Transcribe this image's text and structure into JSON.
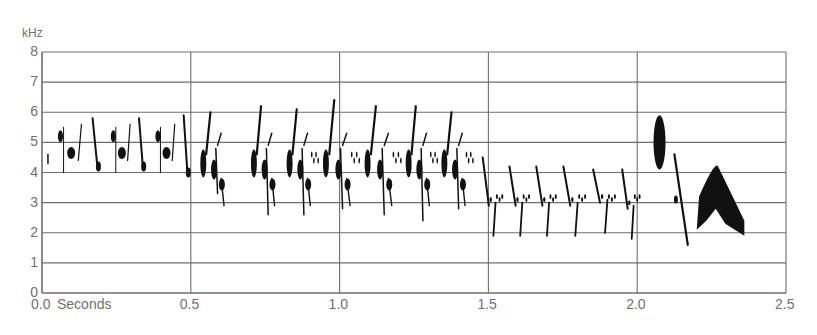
{
  "chart_data": {
    "type": "heatmap",
    "subtype": "spectrogram",
    "title": "",
    "xlabel": "Seconds",
    "ylabel": "kHz",
    "xlim": [
      0.0,
      2.5
    ],
    "ylim": [
      0,
      8
    ],
    "x_ticks": [
      "0.0",
      "0.5",
      "1.0",
      "1.5",
      "2.0",
      "2.5"
    ],
    "y_ticks": [
      "0",
      "1",
      "2",
      "3",
      "4",
      "5",
      "6",
      "7",
      "8"
    ],
    "grid": {
      "horizontal": true,
      "vertical_every_s": 0.5
    },
    "colors": {
      "ink": "#111111",
      "grid": "#6e6e6e",
      "text": "#707070"
    },
    "syllables": [
      {
        "t0": 0.02,
        "t1": 0.03,
        "f_low": 4.3,
        "f_high": 4.6,
        "shape": "dot"
      },
      {
        "t0": 0.05,
        "t1": 0.2,
        "f_low": 3.9,
        "f_high": 5.8,
        "shape": "note-group"
      },
      {
        "t0": 0.23,
        "t1": 0.35,
        "f_low": 3.9,
        "f_high": 5.8,
        "shape": "note-group"
      },
      {
        "t0": 0.38,
        "t1": 0.5,
        "f_low": 3.7,
        "f_high": 5.9,
        "shape": "note-group"
      },
      {
        "t0": 0.53,
        "t1": 0.65,
        "f_low": 3.3,
        "f_high": 6.0,
        "shape": "chevron-group"
      },
      {
        "t0": 0.7,
        "t1": 0.82,
        "f_low": 2.6,
        "f_high": 6.2,
        "shape": "chevron-group"
      },
      {
        "t0": 0.82,
        "t1": 0.94,
        "f_low": 2.6,
        "f_high": 6.1,
        "shape": "chevron-group"
      },
      {
        "t0": 0.94,
        "t1": 1.08,
        "f_low": 2.8,
        "f_high": 6.4,
        "shape": "chevron-group"
      },
      {
        "t0": 1.08,
        "t1": 1.22,
        "f_low": 2.6,
        "f_high": 6.2,
        "shape": "chevron-group"
      },
      {
        "t0": 1.22,
        "t1": 1.34,
        "f_low": 2.4,
        "f_high": 6.2,
        "shape": "chevron-group"
      },
      {
        "t0": 1.34,
        "t1": 1.46,
        "f_low": 2.8,
        "f_high": 6.0,
        "shape": "chevron-group"
      },
      {
        "t0": 1.47,
        "t1": 1.56,
        "f_low": 1.9,
        "f_high": 4.5,
        "shape": "downsweep-pair"
      },
      {
        "t0": 1.56,
        "t1": 1.65,
        "f_low": 1.9,
        "f_high": 4.2,
        "shape": "downsweep-pair"
      },
      {
        "t0": 1.65,
        "t1": 1.74,
        "f_low": 1.9,
        "f_high": 4.2,
        "shape": "downsweep-pair"
      },
      {
        "t0": 1.74,
        "t1": 1.84,
        "f_low": 1.9,
        "f_high": 4.2,
        "shape": "downsweep-pair"
      },
      {
        "t0": 1.84,
        "t1": 1.94,
        "f_low": 2.0,
        "f_high": 4.1,
        "shape": "downsweep-pair"
      },
      {
        "t0": 1.94,
        "t1": 2.02,
        "f_low": 1.8,
        "f_high": 4.1,
        "shape": "downsweep-pair"
      },
      {
        "t0": 2.05,
        "t1": 2.1,
        "f_low": 4.0,
        "f_high": 5.8,
        "shape": "blob"
      },
      {
        "t0": 2.12,
        "t1": 2.17,
        "f_low": 1.6,
        "f_high": 4.6,
        "shape": "downsweep"
      },
      {
        "t0": 2.2,
        "t1": 2.36,
        "f_low": 1.9,
        "f_high": 4.2,
        "shape": "arch"
      }
    ]
  }
}
